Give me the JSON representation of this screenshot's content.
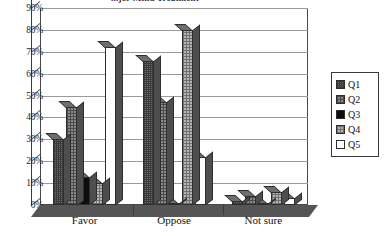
{
  "chart_data": {
    "type": "bar",
    "title": "...jor Mind Treatment",
    "xlabel": "",
    "ylabel": "",
    "ylim": [
      0,
      90
    ],
    "ytick_labels": [
      "0%",
      "10%",
      "20%",
      "30%",
      "40%",
      "50%",
      "60%",
      "70%",
      "80%",
      "90%"
    ],
    "ytick_values": [
      0,
      10,
      20,
      30,
      40,
      50,
      60,
      70,
      80,
      90
    ],
    "categories": [
      "Favor",
      "Oppose",
      "Not sure"
    ],
    "grid": true,
    "legend_position": "right",
    "style": "3d-bar-grayscale",
    "series": [
      {
        "name": "Q1",
        "values": [
          30,
          66,
          2
        ],
        "fill": "dark-crosshatch",
        "color": "#6d6d6d"
      },
      {
        "name": "Q2",
        "values": [
          45,
          47,
          4
        ],
        "fill": "medium-hatch",
        "color": "#8a8a8a"
      },
      {
        "name": "Q3",
        "values": [
          13,
          0,
          0
        ],
        "fill": "solid-black",
        "color": "#0d0d0d"
      },
      {
        "name": "Q4",
        "values": [
          10,
          80,
          6
        ],
        "fill": "light-hatch",
        "color": "#b4b4b4"
      },
      {
        "name": "Q5",
        "values": [
          72,
          22,
          3
        ],
        "fill": "white",
        "color": "#ffffff"
      }
    ]
  },
  "legend": {
    "items": [
      {
        "label": "Q1"
      },
      {
        "label": "Q2"
      },
      {
        "label": "Q3"
      },
      {
        "label": "Q4"
      },
      {
        "label": "Q5"
      }
    ]
  },
  "axis": {
    "y_ticks": [
      "90%",
      "80%",
      "70%",
      "60%",
      "50%",
      "40%",
      "30%",
      "20%",
      "10%",
      "0%"
    ],
    "x_categories": [
      "Favor",
      "Oppose",
      "Not sure"
    ]
  }
}
